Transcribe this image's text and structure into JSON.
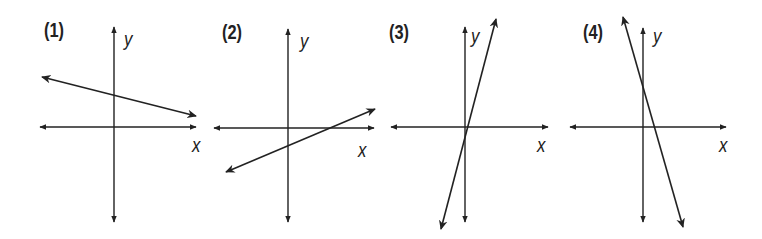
{
  "graphs": [
    {
      "label": "(1)",
      "x_label": "x",
      "y_label": "y",
      "axes": {
        "vx": 114,
        "vtop": 27,
        "vbot": 222,
        "hy": 127,
        "hleft": 40,
        "hright": 196
      },
      "line": {
        "x1": 42,
        "y1": 77,
        "x2": 196,
        "y2": 116
      },
      "description": "line with negative slope, positive y-intercept"
    },
    {
      "label": "(2)",
      "x_label": "x",
      "y_label": "y",
      "axes": {
        "vx": 288,
        "vtop": 29,
        "vbot": 222,
        "hy": 128,
        "hleft": 214,
        "hright": 374
      },
      "line": {
        "x1": 226,
        "y1": 172,
        "x2": 375,
        "y2": 109
      },
      "description": "line with positive slope, negative y-intercept"
    },
    {
      "label": "(3)",
      "x_label": "x",
      "y_label": "y",
      "axes": {
        "vx": 465,
        "vtop": 27,
        "vbot": 222,
        "hy": 127,
        "hleft": 391,
        "hright": 548
      },
      "line": {
        "x1": 441,
        "y1": 229,
        "x2": 496,
        "y2": 19
      },
      "description": "steep line with positive slope through origin"
    },
    {
      "label": "(4)",
      "x_label": "x",
      "y_label": "y",
      "axes": {
        "vx": 643,
        "vtop": 28,
        "vbot": 222,
        "hy": 127,
        "hleft": 570,
        "hright": 726
      },
      "line": {
        "x1": 623,
        "y1": 17,
        "x2": 683,
        "y2": 227
      },
      "description": "steep line with negative slope, positive y-intercept"
    }
  ],
  "colors": {
    "ink": "#222222",
    "background": "#ffffff"
  }
}
